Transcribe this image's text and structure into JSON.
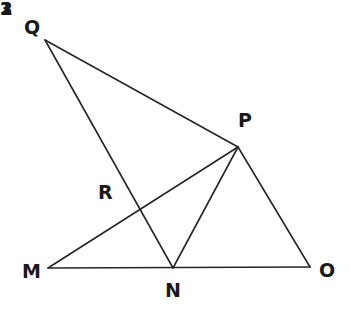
{
  "figure": {
    "canvas": {
      "width": 350,
      "height": 323
    },
    "stroke_color": "#262626",
    "background_color": "#ffffff",
    "stroke_width": 1.6
  },
  "points": {
    "Q": {
      "label": "Q",
      "x": 45,
      "y": 40,
      "label_x": 24,
      "label_y": 18
    },
    "P": {
      "label": "P",
      "x": 238,
      "y": 147,
      "label_x": 238,
      "label_y": 111
    },
    "R": {
      "label": "R",
      "x": 141,
      "y": 211,
      "label_x": 98,
      "label_y": 183
    },
    "M": {
      "label": "M",
      "x": 48,
      "y": 268,
      "label_x": 22,
      "label_y": 262
    },
    "N": {
      "label": "N",
      "x": 173,
      "y": 268,
      "label_x": 165,
      "label_y": 281
    },
    "O": {
      "label": "O",
      "x": 310,
      "y": 267,
      "label_x": 319,
      "label_y": 261
    }
  },
  "segments": [
    {
      "name": "segment-QP",
      "from": "Q",
      "to": "P",
      "x1": 45,
      "y1": 40,
      "x2": 238,
      "y2": 147
    },
    {
      "name": "segment-QN",
      "from": "Q",
      "to": "N",
      "x1": 45,
      "y1": 40,
      "x2": 173,
      "y2": 268
    },
    {
      "name": "segment-MP",
      "from": "M",
      "to": "P",
      "x1": 48,
      "y1": 268,
      "x2": 238,
      "y2": 147
    },
    {
      "name": "segment-MO",
      "from": "M",
      "to": "O",
      "x1": 48,
      "y1": 268,
      "x2": 310,
      "y2": 267
    },
    {
      "name": "segment-NP",
      "from": "N",
      "to": "P",
      "x1": 173,
      "y1": 268,
      "x2": 238,
      "y2": 147
    },
    {
      "name": "segment-PO",
      "from": "P",
      "to": "O",
      "x1": 238,
      "y1": 147,
      "x2": 310,
      "y2": 267
    }
  ],
  "angles": [
    {
      "name": "angle-1",
      "label": "1",
      "x": 186,
      "y": 134,
      "at_vertex": "P"
    },
    {
      "name": "angle-2",
      "label": "2",
      "x": 192,
      "y": 174,
      "at_vertex": "P"
    },
    {
      "name": "angle-3",
      "label": "3",
      "x": 232,
      "y": 174,
      "at_vertex": "P"
    }
  ]
}
